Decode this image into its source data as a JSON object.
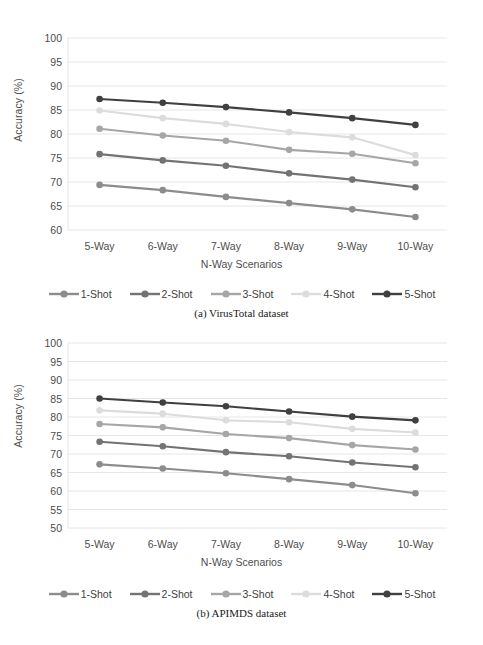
{
  "figure": {
    "background": "#ffffff"
  },
  "series_colors": {
    "1-Shot": "#8c8c8c",
    "2-Shot": "#737373",
    "3-Shot": "#a6a6a6",
    "4-Shot": "#dcdcdc",
    "5-Shot": "#404040"
  },
  "legend": {
    "items": [
      {
        "label": "1-Shot",
        "color": "#8c8c8c"
      },
      {
        "label": "2-Shot",
        "color": "#737373"
      },
      {
        "label": "3-Shot",
        "color": "#a6a6a6"
      },
      {
        "label": "4-Shot",
        "color": "#dcdcdc"
      },
      {
        "label": "5-Shot",
        "color": "#404040"
      }
    ]
  },
  "panel_a": {
    "caption": "(a) VirusTotal dataset"
  },
  "panel_b": {
    "caption": "(b) APIMDS dataset"
  },
  "chart_data": [
    {
      "type": "line",
      "title": "(a) VirusTotal dataset",
      "xlabel": "N-Way Scenarios",
      "ylabel": "Accuracy (%)",
      "categories": [
        "5-Way",
        "6-Way",
        "7-Way",
        "8-Way",
        "9-Way",
        "10-Way"
      ],
      "ylim": [
        60,
        100
      ],
      "yticks": [
        60,
        65,
        70,
        75,
        80,
        85,
        90,
        95,
        100
      ],
      "grid": true,
      "legend_position": "bottom",
      "markers": "circle",
      "series": [
        {
          "name": "1-Shot",
          "color": "#8c8c8c",
          "values": [
            69.4,
            68.3,
            66.9,
            65.6,
            64.3,
            62.7
          ]
        },
        {
          "name": "2-Shot",
          "color": "#737373",
          "values": [
            75.8,
            74.5,
            73.4,
            71.8,
            70.5,
            68.9
          ]
        },
        {
          "name": "3-Shot",
          "color": "#a6a6a6",
          "values": [
            81.1,
            79.7,
            78.6,
            76.7,
            75.9,
            73.9
          ]
        },
        {
          "name": "4-Shot",
          "color": "#dcdcdc",
          "values": [
            84.9,
            83.3,
            82.1,
            80.4,
            79.3,
            75.6
          ]
        },
        {
          "name": "5-Shot",
          "color": "#404040",
          "values": [
            87.3,
            86.5,
            85.6,
            84.5,
            83.3,
            81.9
          ]
        }
      ]
    },
    {
      "type": "line",
      "title": "(b) APIMDS dataset",
      "xlabel": "N-Way Scenarios",
      "ylabel": "Accuracy (%)",
      "categories": [
        "5-Way",
        "6-Way",
        "7-Way",
        "8-Way",
        "9-Way",
        "10-Way"
      ],
      "ylim": [
        50,
        100
      ],
      "yticks": [
        50,
        55,
        60,
        65,
        70,
        75,
        80,
        85,
        90,
        95,
        100
      ],
      "grid": true,
      "legend_position": "bottom",
      "markers": "circle",
      "series": [
        {
          "name": "1-Shot",
          "color": "#8c8c8c",
          "values": [
            67.2,
            66.1,
            64.8,
            63.2,
            61.6,
            59.4
          ]
        },
        {
          "name": "2-Shot",
          "color": "#737373",
          "values": [
            73.3,
            72.1,
            70.5,
            69.4,
            67.7,
            66.4
          ]
        },
        {
          "name": "3-Shot",
          "color": "#a6a6a6",
          "values": [
            78.1,
            77.2,
            75.4,
            74.3,
            72.4,
            71.2
          ]
        },
        {
          "name": "4-Shot",
          "color": "#dcdcdc",
          "values": [
            81.8,
            80.9,
            79.1,
            78.6,
            76.8,
            75.8
          ]
        },
        {
          "name": "5-Shot",
          "color": "#404040",
          "values": [
            85.0,
            83.9,
            82.9,
            81.5,
            80.1,
            79.1
          ]
        }
      ]
    }
  ]
}
